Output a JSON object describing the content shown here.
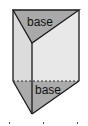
{
  "diagram": {
    "type": "triangular-prism",
    "labels": {
      "top_base": "base",
      "bottom_base": "base"
    },
    "colors": {
      "base_fill": "#a9a9a9",
      "face_fill": "#e3e3e3",
      "edge": "#1a1a1a",
      "background": "#ffffff"
    }
  }
}
